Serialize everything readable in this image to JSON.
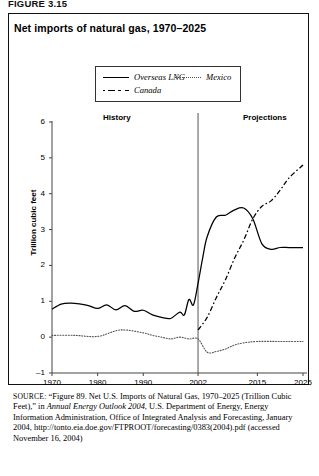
{
  "figure": {
    "label": "FIGURE 3.15",
    "title": "Net imports of natural gas, 1970–2025"
  },
  "legend": {
    "items": [
      {
        "label": "Overseas LNG",
        "style": "solid",
        "icon": "solid-line-swatch"
      },
      {
        "label": "Canada",
        "style": "dashdot",
        "icon": "dash-dot-line-swatch"
      },
      {
        "label": "Mexico",
        "style": "dotted",
        "icon": "dotted-line-swatch"
      }
    ]
  },
  "annotations": {
    "history": "History",
    "projections": "Projections",
    "divider_year": 2002
  },
  "source": {
    "prefix": "SOURCE:",
    "line1": " “Figure 89. Net U.S. Imports of Natural Gas, 1970–2025 (Trillion Cubic Feet),” in ",
    "italic1": "Annual Energy Outlook 2004",
    "line2": ", U.S. Department of Energy, Energy Information Administration, Office of Integrated Analysis and Forecasting, January 2004, http://tonto.eia.doe.gov/FTPROOT/forecasting/0383(2004).pdf (accessed November 16, 2004)"
  },
  "chart_data": {
    "type": "line",
    "title": "Net imports of natural gas, 1970–2025",
    "xlabel": "",
    "ylabel": "Trillion cubic feet",
    "xlim": [
      1970,
      2025
    ],
    "ylim": [
      -1,
      6
    ],
    "yticks": [
      -1,
      0,
      1,
      2,
      3,
      4,
      5,
      6
    ],
    "xticks": [
      1970,
      1980,
      1990,
      2002,
      2015,
      2025
    ],
    "grid": false,
    "legend_position": "top-center",
    "divider_year": 2002,
    "series": [
      {
        "name": "Canada",
        "style": "solid",
        "note": "drawn solid across history and projections",
        "x": [
          1970,
          1972,
          1974,
          1976,
          1978,
          1980,
          1982,
          1984,
          1986,
          1988,
          1990,
          1992,
          1994,
          1996,
          1998,
          1999,
          2000,
          2001,
          2002,
          2003,
          2004,
          2006,
          2008,
          2010,
          2012,
          2014,
          2016,
          2018,
          2020,
          2022,
          2025
        ],
        "y": [
          0.78,
          0.92,
          0.95,
          0.93,
          0.88,
          0.8,
          0.9,
          0.76,
          0.88,
          0.72,
          0.75,
          0.62,
          0.55,
          0.52,
          0.7,
          0.62,
          1.05,
          0.9,
          1.5,
          2.2,
          2.8,
          3.35,
          3.4,
          3.55,
          3.6,
          3.3,
          2.6,
          2.45,
          2.5,
          2.5,
          2.5
        ]
      },
      {
        "name": "Overseas LNG",
        "style": "dashdot",
        "x": [
          2002,
          2004,
          2006,
          2008,
          2010,
          2012,
          2014,
          2016,
          2018,
          2020,
          2022,
          2025
        ],
        "y": [
          0.2,
          0.55,
          1.1,
          1.6,
          2.2,
          2.7,
          3.3,
          3.65,
          3.8,
          4.1,
          4.45,
          4.8
        ]
      },
      {
        "name": "Mexico",
        "style": "dotted",
        "x": [
          1970,
          1975,
          1980,
          1985,
          1990,
          1992,
          1994,
          1996,
          1998,
          2000,
          2002,
          2004,
          2006,
          2008,
          2010,
          2012,
          2015,
          2020,
          2025
        ],
        "y": [
          0.05,
          0.05,
          0.02,
          0.2,
          0.12,
          0.05,
          0.0,
          -0.05,
          0.0,
          -0.05,
          -0.05,
          -0.42,
          -0.4,
          -0.33,
          -0.22,
          -0.16,
          -0.12,
          -0.12,
          -0.12
        ]
      }
    ]
  }
}
